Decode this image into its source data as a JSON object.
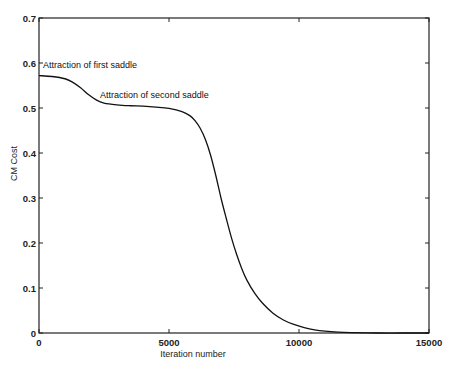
{
  "chart_data": {
    "type": "line",
    "title": "",
    "xlabel": "Iteration number",
    "ylabel": "CM Cost",
    "xlim": [
      0,
      15000
    ],
    "ylim": [
      0,
      0.7
    ],
    "grid": false,
    "legend": null,
    "xticks": [
      0,
      5000,
      10000,
      15000
    ],
    "xtick_labels": [
      "0",
      "5000",
      "10000",
      "15000"
    ],
    "yticks": [
      0,
      0.1,
      0.2,
      0.3,
      0.4,
      0.5,
      0.6,
      0.7
    ],
    "ytick_labels": [
      "0",
      "0.1",
      "0.2",
      "0.3",
      "0.4",
      "0.5",
      "0.6",
      "0.7"
    ],
    "series": [
      {
        "name": "CM Cost",
        "color": "#111111",
        "x": [
          0,
          500,
          1000,
          1300,
          1600,
          1900,
          2200,
          2500,
          3000,
          3500,
          4000,
          4500,
          5000,
          5500,
          5800,
          6000,
          6200,
          6400,
          6600,
          6800,
          7000,
          7200,
          7400,
          7600,
          7800,
          8000,
          8300,
          8600,
          9000,
          9400,
          9800,
          10200,
          10600,
          11000,
          11500,
          12000,
          13000,
          14000,
          15000
        ],
        "values": [
          0.572,
          0.57,
          0.565,
          0.557,
          0.545,
          0.53,
          0.518,
          0.511,
          0.507,
          0.505,
          0.504,
          0.502,
          0.499,
          0.492,
          0.483,
          0.472,
          0.455,
          0.43,
          0.395,
          0.35,
          0.3,
          0.255,
          0.212,
          0.175,
          0.143,
          0.117,
          0.088,
          0.066,
          0.044,
          0.029,
          0.019,
          0.012,
          0.007,
          0.004,
          0.002,
          0.001,
          0.0,
          0.0,
          0.0
        ]
      }
    ],
    "annotations": [
      {
        "text": "Attraction of first saddle",
        "x": 150,
        "y": 0.59
      },
      {
        "text": "Attraction of second saddle",
        "x": 2350,
        "y": 0.522
      }
    ]
  }
}
